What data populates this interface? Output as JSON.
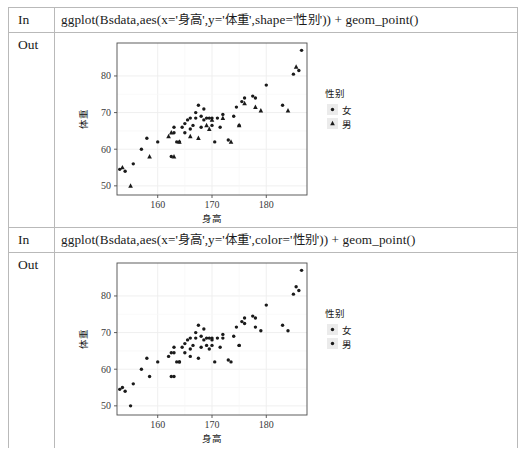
{
  "notebook": {
    "cells": [
      {
        "in_label": "In",
        "out_label": "Out",
        "code_prefix": "ggplot(Bsdata,aes(x='",
        "code_x_var": "身高",
        "code_mid1": "',y='",
        "code_y_var": "体重",
        "code_mid2": "',shape='",
        "code_group_var": "性别",
        "code_suffix": "')) + geom_point()"
      },
      {
        "in_label": "In",
        "out_label": "Out",
        "code_prefix": "ggplot(Bsdata,aes(x='",
        "code_x_var": "身高",
        "code_mid1": "',y='",
        "code_y_var": "体重",
        "code_mid2": "',color='",
        "code_group_var": "性别",
        "code_suffix": "')) + geom_point()"
      }
    ]
  },
  "chart_data": [
    {
      "type": "scatter",
      "title": "",
      "xlabel": "身高",
      "ylabel": "体重",
      "xlim": [
        152.5,
        187.5
      ],
      "ylim": [
        47.5,
        89.0
      ],
      "xticks": [
        160,
        170,
        180
      ],
      "yticks": [
        50,
        60,
        70,
        80
      ],
      "grid": true,
      "aesthetic": "shape",
      "legend": {
        "title": "性别",
        "position": "right",
        "entries": [
          {
            "label": "女",
            "marker": "circle"
          },
          {
            "label": "男",
            "marker": "triangle"
          }
        ]
      },
      "series": [
        {
          "name": "女",
          "marker": "circle",
          "x": [
            153.0,
            154.0,
            155.5,
            157.0,
            158.0,
            160.0,
            162.5,
            163.0,
            163.0,
            163.5,
            164.0,
            164.5,
            165.0,
            165.0,
            165.5,
            166.0,
            166.0,
            166.5,
            167.0,
            167.0,
            167.5,
            168.0,
            168.0,
            168.5,
            168.5,
            169.0,
            169.5,
            170.0,
            170.0,
            170.5,
            171.0,
            171.5,
            172.0,
            173.0,
            174.0,
            174.5,
            175.0,
            175.5,
            176.0,
            177.5,
            178.0,
            180.0,
            183.0,
            185.0,
            186.0,
            186.5
          ],
          "y": [
            54.5,
            54.0,
            56.0,
            60.0,
            63.0,
            62.0,
            58.0,
            64.5,
            66.0,
            62.0,
            62.0,
            66.0,
            64.5,
            67.0,
            68.0,
            68.5,
            65.5,
            66.5,
            70.0,
            68.5,
            72.0,
            69.0,
            66.0,
            71.0,
            68.0,
            68.5,
            68.5,
            68.5,
            66.5,
            62.0,
            68.5,
            66.0,
            69.5,
            62.5,
            69.0,
            71.5,
            66.5,
            73.0,
            74.0,
            74.5,
            74.0,
            77.5,
            72.0,
            80.5,
            81.5,
            87.0
          ]
        },
        {
          "name": "男",
          "marker": "triangle",
          "x": [
            153.5,
            155.0,
            158.5,
            162.0,
            162.5,
            163.0,
            164.0,
            166.0,
            167.5,
            169.0,
            169.5,
            170.0,
            172.0,
            173.5,
            175.0,
            176.0,
            178.0,
            179.0,
            184.0,
            185.5
          ],
          "y": [
            55.0,
            50.0,
            58.0,
            63.5,
            64.5,
            58.0,
            62.0,
            63.5,
            63.0,
            66.5,
            65.5,
            68.0,
            68.5,
            62.0,
            66.5,
            72.5,
            71.5,
            70.5,
            70.5,
            82.5
          ]
        }
      ]
    },
    {
      "type": "scatter",
      "title": "",
      "xlabel": "身高",
      "ylabel": "体重",
      "xlim": [
        152.5,
        187.5
      ],
      "ylim": [
        47.5,
        89.0
      ],
      "xticks": [
        160,
        170,
        180
      ],
      "yticks": [
        50,
        60,
        70,
        80
      ],
      "grid": true,
      "aesthetic": "color",
      "legend": {
        "title": "性别",
        "position": "right",
        "entries": [
          {
            "label": "女",
            "marker": "circle"
          },
          {
            "label": "男",
            "marker": "circle"
          }
        ]
      },
      "series": [
        {
          "name": "女",
          "marker": "circle",
          "x": [
            153.0,
            154.0,
            155.5,
            157.0,
            158.0,
            160.0,
            162.5,
            163.0,
            163.0,
            163.5,
            164.0,
            164.5,
            165.0,
            165.0,
            165.5,
            166.0,
            166.0,
            166.5,
            167.0,
            167.0,
            167.5,
            168.0,
            168.0,
            168.5,
            168.5,
            169.0,
            169.5,
            170.0,
            170.0,
            170.5,
            171.0,
            171.5,
            172.0,
            173.0,
            174.0,
            174.5,
            175.0,
            175.5,
            176.0,
            177.5,
            178.0,
            180.0,
            183.0,
            185.0,
            186.0,
            186.5
          ],
          "y": [
            54.5,
            54.0,
            56.0,
            60.0,
            63.0,
            62.0,
            58.0,
            64.5,
            66.0,
            62.0,
            62.0,
            66.0,
            64.5,
            67.0,
            68.0,
            68.5,
            65.5,
            66.5,
            70.0,
            68.5,
            72.0,
            69.0,
            66.0,
            71.0,
            68.0,
            68.5,
            68.5,
            68.5,
            66.5,
            62.0,
            68.5,
            66.0,
            69.5,
            62.5,
            69.0,
            71.5,
            66.5,
            73.0,
            74.0,
            74.5,
            74.0,
            77.5,
            72.0,
            80.5,
            81.5,
            87.0
          ]
        },
        {
          "name": "男",
          "marker": "circle",
          "x": [
            153.5,
            155.0,
            158.5,
            162.0,
            162.5,
            163.0,
            164.0,
            166.0,
            167.5,
            169.0,
            169.5,
            170.0,
            172.0,
            173.5,
            175.0,
            176.0,
            178.0,
            179.0,
            184.0,
            185.5
          ],
          "y": [
            55.0,
            50.0,
            58.0,
            63.5,
            64.5,
            58.0,
            62.0,
            63.5,
            63.0,
            66.5,
            65.5,
            68.0,
            68.5,
            62.0,
            66.5,
            72.5,
            71.5,
            70.5,
            70.5,
            82.5
          ]
        }
      ]
    }
  ],
  "colors": {
    "point": "#1a1a1a",
    "grid": "#ededed",
    "panel_border": "#4d4d4d",
    "table_border": "#b9b9b9",
    "legend_key_bg": "#ebebeb"
  }
}
